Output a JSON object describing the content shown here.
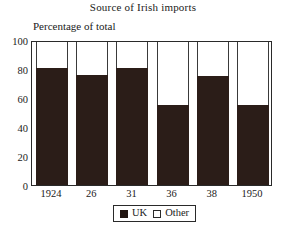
{
  "chart_data": {
    "type": "bar",
    "title": "Source of Irish imports",
    "subtitle": "Percentage of total",
    "xlabel": "",
    "ylabel": "Percentage of total",
    "categories": [
      "1924",
      "26",
      "31",
      "36",
      "38",
      "1950"
    ],
    "series": [
      {
        "name": "UK",
        "values": [
          81,
          76,
          81,
          55,
          75,
          55
        ],
        "color": "#2b1d18"
      },
      {
        "name": "Other",
        "values": [
          19,
          24,
          19,
          45,
          25,
          45
        ],
        "color": "#ffffff"
      }
    ],
    "stacked": true,
    "ylim": [
      0,
      100
    ],
    "yticks": [
      0,
      20,
      40,
      60,
      80,
      100
    ],
    "ytick_labels": [
      "0",
      "20",
      "40",
      "60",
      "80",
      "100"
    ],
    "grid": false,
    "legend": {
      "position": "bottom",
      "entries": [
        {
          "label": "UK",
          "swatch": "filled-square-icon"
        },
        {
          "label": "Other",
          "swatch": "open-square-icon"
        }
      ]
    }
  },
  "colors": {
    "uk_fill": "#2b1d18",
    "other_fill": "#ffffff",
    "axis": "#2a2a2a",
    "background": "#ffffff",
    "text": "#1a1a1a"
  }
}
